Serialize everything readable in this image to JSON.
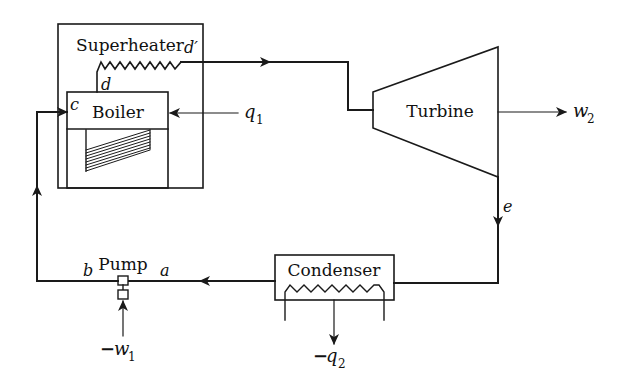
{
  "diagram": {
    "type": "Rankine cycle with superheat (steam power plant schematic)",
    "components": {
      "superheater": {
        "label": "Superheater"
      },
      "boiler": {
        "label": "Boiler"
      },
      "turbine": {
        "label": "Turbine"
      },
      "condenser": {
        "label": "Condenser"
      },
      "pump": {
        "label": "Pump"
      }
    },
    "state_points": {
      "a": "a",
      "b": "b",
      "c": "c",
      "d": "d",
      "d_prime": "d′",
      "e": "e"
    },
    "energy_flows": {
      "q1": {
        "symbol": "q",
        "subscript": "1",
        "direction": "into boiler"
      },
      "w2": {
        "symbol": "w",
        "subscript": "2",
        "direction": "out of turbine"
      },
      "q2": {
        "prefix": "−",
        "symbol": "q",
        "subscript": "2",
        "direction": "out of condenser"
      },
      "w1": {
        "prefix": "−",
        "symbol": "w",
        "subscript": "1",
        "direction": "into pump"
      }
    },
    "colors": {
      "line": "#1a1a1a",
      "background": "#ffffff"
    }
  }
}
